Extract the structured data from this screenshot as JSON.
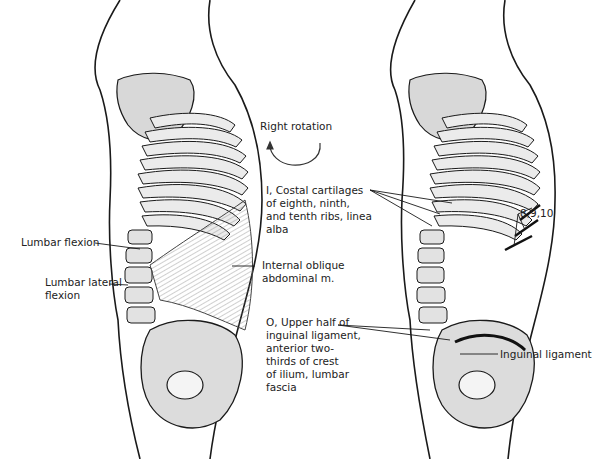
{
  "figure": {
    "left_panel": {
      "title": "Internal oblique abdominal muscle — action view",
      "labels": {
        "rotation": "Right rotation",
        "lumbar_flexion": "Lumbar flexion",
        "lumbar_lateral_flexion": "Lumbar lateral\nflexion",
        "muscle": "Internal oblique\nabdominal m.",
        "insertion": "I, Costal cartilages\nof eighth, ninth,\nand tenth ribs, linea\nalba",
        "origin": "O, Upper half of\ninguinal ligament,\nanterior two-\nthirds of crest\nof ilium, lumbar\nfascia"
      }
    },
    "right_panel": {
      "labels": {
        "ribs": "8,9,10",
        "ligament": "Inguinal ligament"
      }
    },
    "icons": {
      "rotation_arrow": "curved-arrow-counterclockwise"
    },
    "colors": {
      "line": "#1a1a1a",
      "bone_shade": "#cfcfcf",
      "muscle_shade": "#bdbdbd",
      "background": "#ffffff"
    }
  }
}
